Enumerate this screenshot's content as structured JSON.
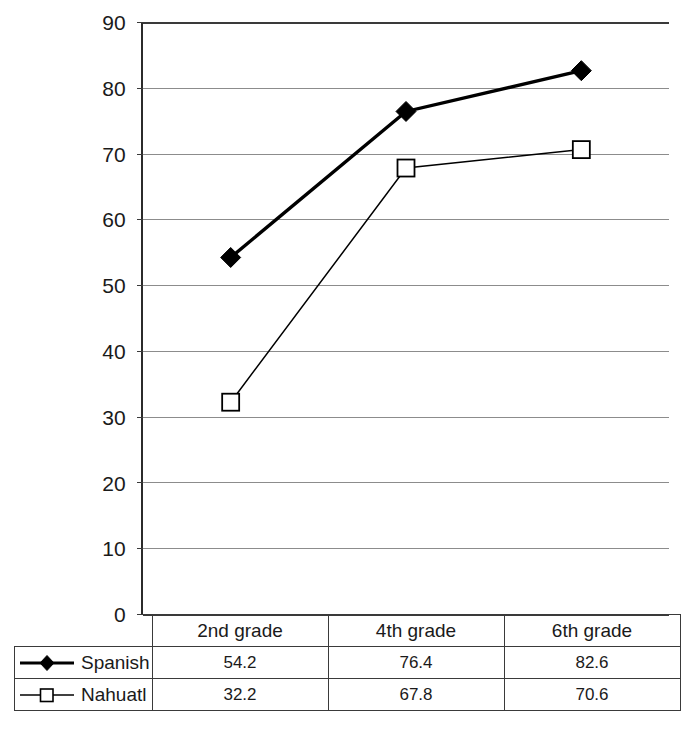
{
  "chart_data": {
    "type": "line",
    "title": "",
    "xlabel": "",
    "ylabel": "",
    "categories": [
      "2nd grade",
      "4th grade",
      "6th grade"
    ],
    "series": [
      {
        "name": "Spanish",
        "values": [
          54.2,
          76.4,
          82.6
        ],
        "marker": "filled-diamond",
        "line": "thick-black",
        "color": "#000000"
      },
      {
        "name": "Nahuatl",
        "values": [
          32.2,
          67.8,
          70.6
        ],
        "marker": "open-square",
        "line": "thin-black",
        "color": "#000000"
      }
    ],
    "ylim": [
      0,
      90
    ],
    "ytick_step": 10,
    "yticks": [
      "0",
      "10",
      "20",
      "30",
      "40",
      "50",
      "60",
      "70",
      "80",
      "90"
    ],
    "grid": "horizontal",
    "legend_position": "data-table-left-column"
  },
  "table": {
    "corner_label": "",
    "column_headers": [
      "2nd grade",
      "4th grade",
      "6th grade"
    ],
    "rows": [
      {
        "label": "Spanish",
        "values": [
          "54.2",
          "76.4",
          "82.6"
        ]
      },
      {
        "label": "Nahuatl",
        "values": [
          "32.2",
          "67.8",
          "70.6"
        ]
      }
    ]
  },
  "colors": {
    "gridline": "#8c8c8c",
    "axis": "#3a3a3a",
    "series_spanish": "#000000",
    "series_nahuatl": "#000000",
    "background": "#ffffff"
  }
}
